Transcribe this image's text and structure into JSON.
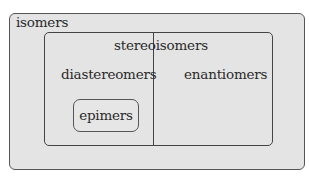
{
  "diagram": {
    "type": "nested-set (Euler) diagram",
    "sets": {
      "outer": {
        "label": "isomers"
      },
      "inner": {
        "label": "stereoisomers"
      },
      "left_partition": {
        "label": "diastereomers"
      },
      "right_partition": {
        "label": "enantiomers"
      },
      "subset": {
        "label": "epimers"
      }
    },
    "relationships": [
      {
        "child": "stereoisomers",
        "parent": "isomers"
      },
      {
        "child": "diastereomers",
        "parent": "stereoisomers"
      },
      {
        "child": "enantiomers",
        "parent": "stereoisomers"
      },
      {
        "child": "epimers",
        "parent": "diastereomers"
      }
    ],
    "colors": {
      "fill": "#e4e4e4",
      "border": "#555555",
      "text": "#2a2a2a"
    }
  }
}
